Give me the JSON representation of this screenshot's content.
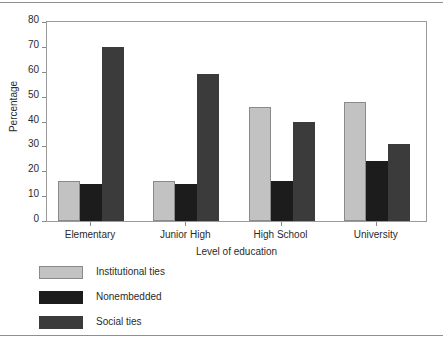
{
  "chart_data": {
    "type": "bar",
    "title": "",
    "xlabel": "Level of education",
    "ylabel": "Percentage",
    "categories": [
      "Elementary",
      "Junior High",
      "High School",
      "University"
    ],
    "series": [
      {
        "name": "Institutional ties",
        "color": "#c2c2c2",
        "values": [
          16,
          16,
          46,
          48
        ]
      },
      {
        "name": "Nonembedded",
        "color": "#1c1c1c",
        "values": [
          15,
          15,
          16,
          24
        ]
      },
      {
        "name": "Social ties",
        "color": "#3b3b3b",
        "values": [
          70,
          59,
          40,
          31
        ]
      }
    ],
    "ylim": [
      0,
      80
    ],
    "yticks": [
      0,
      10,
      20,
      30,
      40,
      50,
      60,
      70,
      80
    ],
    "ytick_labels": [
      "0",
      "10",
      "20",
      "30",
      "40",
      "50",
      "60",
      "70",
      "80"
    ],
    "grid": false,
    "legend_position": "below-left",
    "frame": true
  }
}
